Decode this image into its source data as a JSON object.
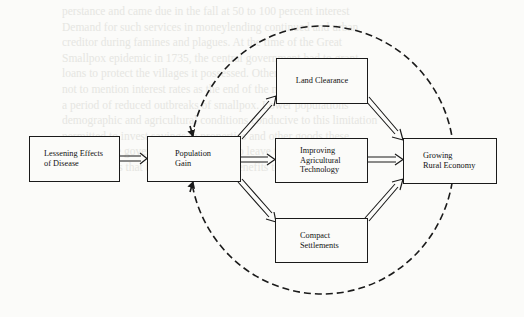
{
  "diagram": {
    "type": "flow-diagram",
    "nodes": {
      "disease": {
        "label": "Lessening Effects of Disease",
        "lines": [
          "Lessening Effects",
          "of Disease"
        ]
      },
      "population": {
        "label": "Population Gain",
        "lines": [
          "Population",
          "Gain"
        ]
      },
      "land": {
        "label": "Land Clearance",
        "lines": [
          "Land Clearance"
        ]
      },
      "technology": {
        "label": "Improving Agricultural Technology",
        "lines": [
          "Improving",
          "Agricultural",
          "Technology"
        ]
      },
      "settlements": {
        "label": "Compact Settlements",
        "lines": [
          "Compact",
          "Settlements"
        ]
      },
      "economy": {
        "label": "Growing Rural Economy",
        "lines": [
          "Growing",
          "Rural Economy"
        ]
      }
    },
    "edges": [
      {
        "from": "disease",
        "to": "population",
        "style": "double-arrow"
      },
      {
        "from": "population",
        "to": "land",
        "style": "double-arrow"
      },
      {
        "from": "population",
        "to": "technology",
        "style": "double-arrow"
      },
      {
        "from": "population",
        "to": "settlements",
        "style": "double-arrow"
      },
      {
        "from": "land",
        "to": "economy",
        "style": "double-arrow"
      },
      {
        "from": "technology",
        "to": "economy",
        "style": "double-arrow"
      },
      {
        "from": "settlements",
        "to": "economy",
        "style": "double-arrow"
      },
      {
        "from": "economy",
        "to": "population",
        "style": "dashed-feedback-loop"
      }
    ],
    "colors": {
      "ink": "#1a1a1a",
      "paper": "#fbfbf9",
      "bleed_through": "#e6e6e2"
    }
  },
  "background_text": [
    "perstance and came due in the fall at 50 to 100 percent interest",
    "Demand for such services in moneylending continued and urban",
    "creditor during famines and plagues. At the time of the Great",
    "Smallpox epidemic in 1735, the central government had to grant",
    "loans to protect the villages it possessed. Other allies remained",
    "not to mention interest rates as the end of the mid eighth century",
    "a period of reduced outbreaks of smallpox. Lower populations",
    "demographic and agricultural conditions conducive to this limitation",
    "permitted to invest savings in properties and other goods these",
    "estates ... the government was forced to leave the taxation",
    "opportunities that brought economic benefits to everyone"
  ]
}
